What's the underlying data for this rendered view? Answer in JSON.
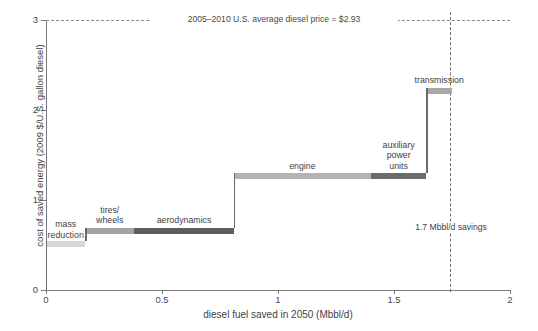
{
  "figure": {
    "partial_title": "",
    "background": "#ffffff"
  },
  "axes": {
    "y_title": "cost of saved energy (2009 $/U.S. gallon diesel)",
    "x_title": "diesel fuel saved in 2050 (Mbbl/d)",
    "y_ticks": [
      "0",
      "1",
      "2",
      "3"
    ],
    "x_ticks": [
      "0",
      "0.5",
      "1",
      "1.5",
      "2"
    ],
    "axis_color": "#7a7a7a"
  },
  "annotations": {
    "price_line_label": "2005–2010 U.S. average diesel price = $2.93",
    "savings_label": "1.7 Mbbl/d\nsavings"
  },
  "chart_data": {
    "type": "bar",
    "xlabel": "diesel fuel saved in 2050 (Mbbl/d)",
    "ylabel": "cost of saved energy (2009 $/U.S. gallon diesel)",
    "xlim": [
      0,
      2
    ],
    "ylim": [
      0,
      3
    ],
    "xticks": [
      0,
      0.5,
      1,
      1.5,
      2
    ],
    "yticks": [
      0,
      1,
      2,
      3
    ],
    "grid": false,
    "legend": "none",
    "chart_style": "supply-curve / cost-curve (stacked step widths)",
    "reference_lines": [
      {
        "orientation": "horizontal",
        "value": 2.93,
        "style": "dashed",
        "label": "2005–2010 U.S. average diesel price = $2.93"
      },
      {
        "orientation": "vertical",
        "value": 1.7,
        "style": "dashed",
        "label": "1.7 Mbbl/d savings"
      }
    ],
    "categories": [
      "mass reduction",
      "tires/wheels",
      "aerodynamics",
      "engine",
      "auxiliary power units",
      "transmission"
    ],
    "values": [
      0.54,
      0.69,
      0.69,
      1.3,
      1.3,
      2.25
    ],
    "x_start": [
      0.0,
      0.17,
      0.38,
      0.81,
      1.4,
      1.64
    ],
    "x_end": [
      0.17,
      0.38,
      0.81,
      1.4,
      1.64,
      1.75
    ],
    "widths": [
      0.17,
      0.21,
      0.43,
      0.59,
      0.24,
      0.11
    ],
    "bars": [
      {
        "name": "mass reduction",
        "label": "mass\nreduction",
        "x_start": 0.0,
        "x_end": 0.17,
        "value": 0.54,
        "color": "#d8d8d8",
        "label_position": "inside-left"
      },
      {
        "name": "tires/wheels",
        "label": "tires/\nwheels",
        "x_start": 0.17,
        "x_end": 0.38,
        "value": 0.69,
        "color": "#a3a3a3",
        "label_position": "above"
      },
      {
        "name": "aerodynamics",
        "label": "aerodynamics",
        "x_start": 0.38,
        "x_end": 0.81,
        "value": 0.69,
        "color": "#5e5e5e",
        "label_position": "above"
      },
      {
        "name": "engine",
        "label": "engine",
        "x_start": 0.81,
        "x_end": 1.4,
        "value": 1.3,
        "color": "#b4b4b4",
        "label_position": "above"
      },
      {
        "name": "auxiliary power units",
        "label": "auxiliary\npower\nunits",
        "x_start": 1.4,
        "x_end": 1.64,
        "value": 1.3,
        "color": "#6b6b6b",
        "label_position": "above"
      },
      {
        "name": "transmission",
        "label": "transmission",
        "x_start": 1.64,
        "x_end": 1.75,
        "value": 2.25,
        "color": "#a9a9a9",
        "label_position": "above"
      }
    ]
  }
}
